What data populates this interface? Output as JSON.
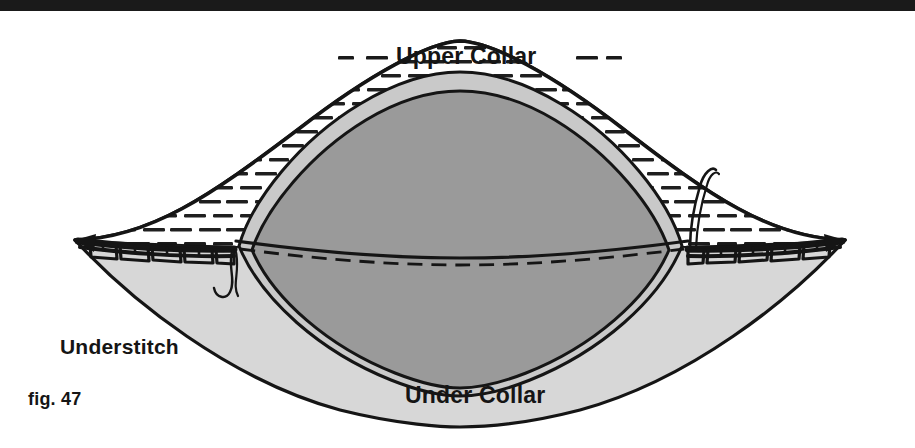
{
  "figure": {
    "caption": "fig. 47",
    "title_region": "collar-understitching-diagram",
    "labels": {
      "upper_collar": "Upper Collar",
      "under_collar": "Under Collar",
      "understitch": "Understitch"
    },
    "colors": {
      "ink": "#151515",
      "page_background": "#ffffff",
      "top_rule": "#1a1a1a",
      "upper_collar_fill": "#ffffff",
      "under_collar_fill": "#d7d7d7",
      "inner_panel_fill": "#9a9a9a",
      "inner_panel_edge_fill": "#c9c9c9",
      "hatch_dash": "#1a1a1a"
    },
    "elements": {
      "top_rule": "horizontal-rule",
      "hatching": "dashed-horizontal-hatch",
      "seam_line": "solid-and-dashed-seam",
      "stitch_row_left": "understitch-row",
      "stitch_row_right": "understitch-row",
      "thread_tail_left": "loose-thread",
      "thread_tail_right": "loose-thread"
    }
  }
}
